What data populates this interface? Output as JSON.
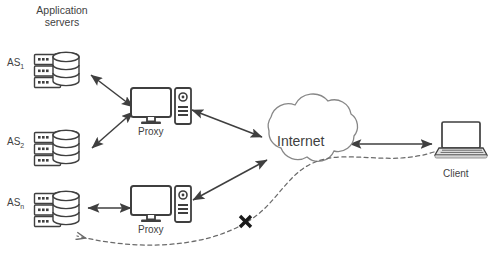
{
  "figure": {
    "title_group": {
      "line1": "Application",
      "line2": "servers"
    },
    "caption": "",
    "colors": {
      "stroke": "#3f3f3f",
      "text": "#3f3f3f",
      "background": "#ffffff",
      "icon_fill": "#ffffff",
      "icon_shadow": "#d9d9d9",
      "dashed": "#6b6b6b"
    }
  },
  "nodes": [
    {
      "id": "as1",
      "icon": "database-server-stack-icon",
      "label_main": "AS",
      "label_sub": "1"
    },
    {
      "id": "as2",
      "icon": "database-server-stack-icon",
      "label_main": "AS",
      "label_sub": "2"
    },
    {
      "id": "asn",
      "icon": "database-server-stack-icon",
      "label_main": "AS",
      "label_sub": "n"
    },
    {
      "id": "proxy1",
      "icon": "desktop-computer-icon",
      "label": "Proxy"
    },
    {
      "id": "proxy2",
      "icon": "desktop-computer-icon",
      "label": "Proxy"
    },
    {
      "id": "internet",
      "icon": "cloud-icon",
      "label": "Internet"
    },
    {
      "id": "client",
      "icon": "laptop-icon",
      "label": "Client"
    }
  ],
  "connections": [
    {
      "id": "as1-proxy1",
      "from": "AS",
      "to": "Proxy",
      "style": "solid",
      "arrows": "both"
    },
    {
      "id": "as2-proxy1",
      "from": "AS",
      "to": "Proxy",
      "style": "solid",
      "arrows": "both"
    },
    {
      "id": "asn-proxy2",
      "from": "AS",
      "to": "Proxy",
      "style": "solid",
      "arrows": "both"
    },
    {
      "id": "proxy1-internet",
      "from": "Proxy",
      "to": "Internet",
      "style": "solid",
      "arrows": "both"
    },
    {
      "id": "proxy2-internet",
      "from": "Proxy",
      "to": "Internet",
      "style": "solid",
      "arrows": "both"
    },
    {
      "id": "internet-client",
      "from": "Internet",
      "to": "Client",
      "style": "solid",
      "arrows": "both"
    },
    {
      "id": "client-asn-blocked",
      "from": "Client",
      "to": "AS",
      "style": "dashed",
      "arrows": "end",
      "marker": "X"
    }
  ],
  "markers": {
    "blocked_symbol": "X"
  }
}
